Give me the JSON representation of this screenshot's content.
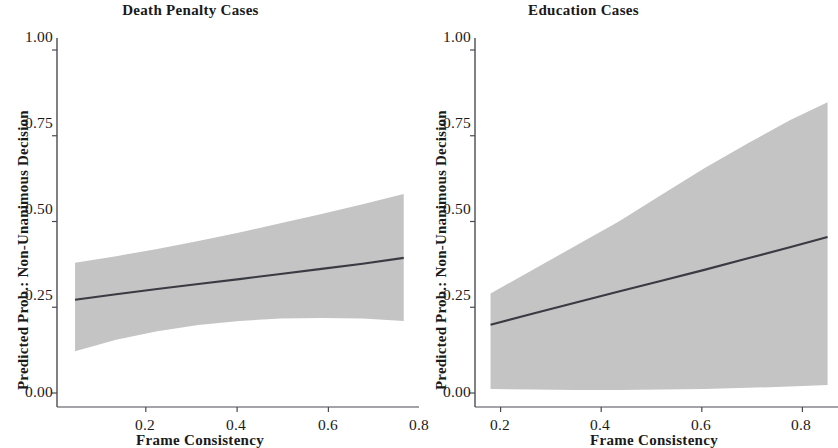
{
  "figure": {
    "background": "#ffffff",
    "line_color": "#3a3a42",
    "band_color": "#c4c4c4",
    "axis_color": "#4a4a52"
  },
  "chart_data": [
    {
      "type": "line",
      "panel": "left",
      "title": "Death Penalty Cases",
      "xlabel": "Frame Consistency",
      "ylabel": "Predicted Prob.: Non-Unanimous Decision",
      "xlim": [
        0.03,
        0.8
      ],
      "ylim": [
        0.0,
        1.05
      ],
      "xticks": [
        0.2,
        0.4,
        0.6,
        0.8
      ],
      "xticklabels": [
        "0.2",
        "0.4",
        "0.6",
        "0.8"
      ],
      "yticks": [
        0.0,
        0.25,
        0.5,
        0.75,
        1.0
      ],
      "yticklabels": [
        "0.00",
        "0.25",
        "0.50",
        "0.75",
        "1.00"
      ],
      "grid": false,
      "legend": null,
      "series": [
        {
          "name": "Predicted probability",
          "x": [
            0.045,
            0.135,
            0.225,
            0.315,
            0.405,
            0.495,
            0.585,
            0.675,
            0.765
          ],
          "values": [
            0.272,
            0.288,
            0.303,
            0.318,
            0.332,
            0.347,
            0.362,
            0.377,
            0.394
          ]
        }
      ],
      "confidence_band": {
        "x": [
          0.045,
          0.135,
          0.225,
          0.315,
          0.405,
          0.495,
          0.585,
          0.675,
          0.765
        ],
        "lower": [
          0.122,
          0.155,
          0.18,
          0.198,
          0.21,
          0.217,
          0.219,
          0.217,
          0.21
        ],
        "upper": [
          0.38,
          0.399,
          0.42,
          0.443,
          0.468,
          0.495,
          0.522,
          0.55,
          0.58
        ]
      }
    },
    {
      "type": "line",
      "panel": "right",
      "title": "Education Cases",
      "xlabel": "Frame Consistency",
      "ylabel": "Predicted Prob.: Non-Unanimous Decision",
      "xlim": [
        0.17,
        0.87
      ],
      "ylim": [
        0.0,
        1.05
      ],
      "xticks": [
        0.2,
        0.4,
        0.6,
        0.8
      ],
      "xticklabels": [
        "0.2",
        "0.4",
        "0.6",
        "0.8"
      ],
      "yticks": [
        0.0,
        0.25,
        0.5,
        0.75,
        1.0
      ],
      "yticklabels": [
        "0.00",
        "0.25",
        "0.50",
        "0.75",
        "1.00"
      ],
      "grid": false,
      "legend": null,
      "series": [
        {
          "name": "Predicted probability",
          "x": [
            0.18,
            0.265,
            0.35,
            0.435,
            0.52,
            0.605,
            0.69,
            0.775,
            0.85
          ],
          "values": [
            0.199,
            0.232,
            0.264,
            0.296,
            0.327,
            0.359,
            0.392,
            0.425,
            0.455
          ]
        }
      ],
      "confidence_band": {
        "x": [
          0.18,
          0.265,
          0.35,
          0.435,
          0.52,
          0.605,
          0.69,
          0.775,
          0.85
        ],
        "lower": [
          0.012,
          0.01,
          0.009,
          0.009,
          0.01,
          0.012,
          0.015,
          0.019,
          0.023
        ],
        "upper": [
          0.29,
          0.36,
          0.43,
          0.5,
          0.578,
          0.655,
          0.727,
          0.795,
          0.848
        ]
      }
    }
  ]
}
